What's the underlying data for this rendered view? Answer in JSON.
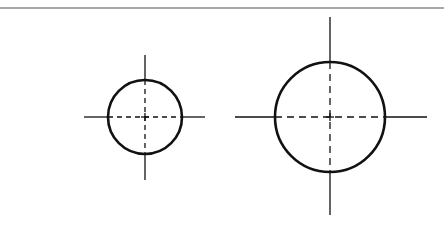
{
  "diagram": {
    "type": "technical-drawing",
    "background": "#ffffff",
    "stroke_color": "#111111",
    "border_color": "#8a8a8a",
    "top_rule": {
      "y": 8,
      "x1": 0,
      "x2": 444
    },
    "circles": [
      {
        "id": "small-circle",
        "cx": 145,
        "cy": 117,
        "r": 37,
        "vertical_centerline": {
          "y1": 55,
          "y2": 180
        },
        "horizontal_centerline": {
          "x1": 84,
          "x2": 205
        }
      },
      {
        "id": "large-circle",
        "cx": 330,
        "cy": 117,
        "r": 55,
        "vertical_centerline": {
          "y1": 17,
          "y2": 215
        },
        "horizontal_centerline": {
          "x1": 235,
          "x2": 427
        }
      }
    ]
  }
}
